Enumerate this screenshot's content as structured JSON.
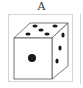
{
  "option": {
    "label": "A",
    "die": {
      "front_face_pips": 1,
      "top_face_pips": 5,
      "right_face_pips": 3
    }
  },
  "colors": {
    "pip": "#1a1a1a",
    "edge": "#555555",
    "frame": "#d4d4d4"
  }
}
